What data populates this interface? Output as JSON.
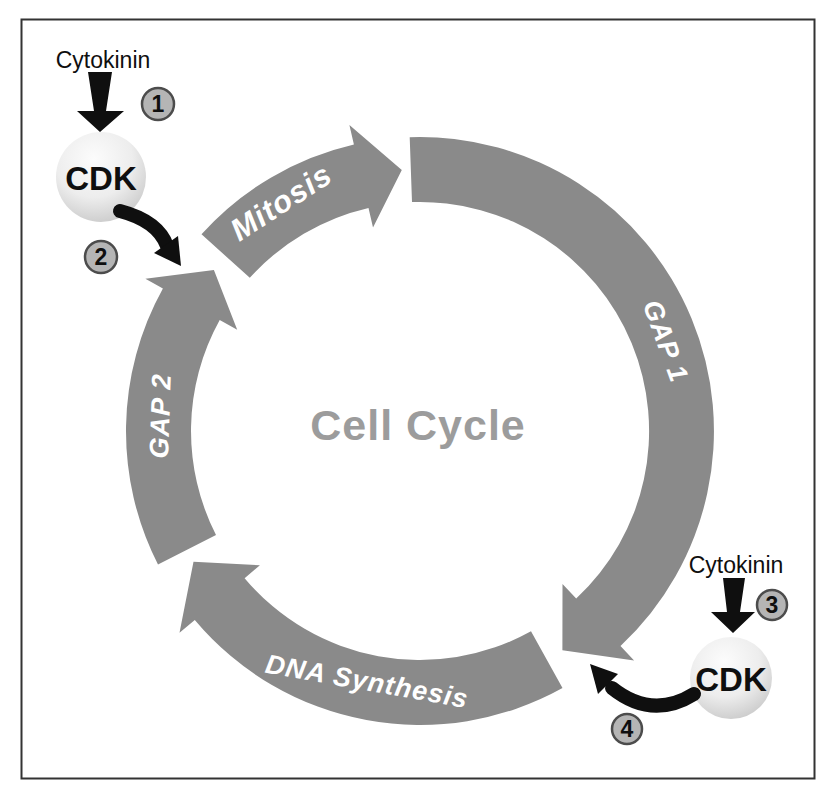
{
  "figure": {
    "type": "cell-cycle-diagram"
  },
  "cycle": {
    "center_label": "Cell Cycle",
    "phases": [
      {
        "id": "mitosis",
        "label": "Mitosis"
      },
      {
        "id": "gap1",
        "label": "GAP 1"
      },
      {
        "id": "dna-synthesis",
        "label": "DNA Synthesis"
      },
      {
        "id": "gap2",
        "label": "GAP 2"
      }
    ]
  },
  "regulators": [
    {
      "signal": "Cytokinin",
      "protein": "CDK",
      "input_step": "1",
      "output_step": "2"
    },
    {
      "signal": "Cytokinin",
      "protein": "CDK",
      "input_step": "3",
      "output_step": "4"
    }
  ],
  "colors": {
    "arc": "#8a8a8a",
    "arc_label": "#ffffff",
    "center_label": "#9c9c9c",
    "ink": "#0f0f0f",
    "badge_fill": "#b5b5b5",
    "badge_border": "#4c4c4c",
    "frame_border": "#333333",
    "sphere_light": "#fcfcfc",
    "sphere_mid": "#ededed",
    "sphere_dark": "#c6c6c6",
    "background": "#ffffff"
  }
}
